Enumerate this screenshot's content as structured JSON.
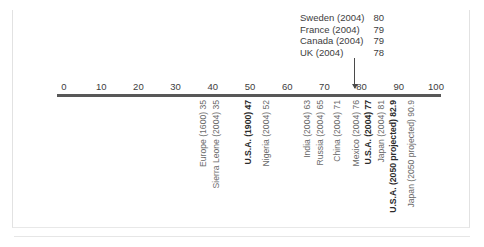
{
  "chart_data": {
    "type": "scatter",
    "title": "",
    "subtitle": "",
    "xlabel": "",
    "ylabel": "",
    "xlim": [
      0,
      100
    ],
    "xticks": [
      0,
      10,
      20,
      30,
      40,
      50,
      60,
      70,
      80,
      90,
      100
    ],
    "tick_labels": [
      "0",
      "10",
      "20",
      "30",
      "40",
      "50",
      "60",
      "70",
      "80",
      "90",
      "100"
    ],
    "grid": false,
    "legend": "none",
    "axis_color": "#585858",
    "text_color": "#3d3d3d",
    "points": [
      {
        "label": "Europe (1600) 35",
        "name": "Europe",
        "year": "1600",
        "value": 35,
        "bold": false
      },
      {
        "label": "Sierra Leone (2004) 35",
        "name": "Sierra Leone",
        "year": "2004",
        "value": 35,
        "bold": false
      },
      {
        "label": "U.S.A. (1900) 47",
        "name": "U.S.A.",
        "year": "1900",
        "value": 47,
        "bold": true
      },
      {
        "label": "Nigeria (2004) 52",
        "name": "Nigeria",
        "year": "2004",
        "value": 52,
        "bold": false
      },
      {
        "label": "India (2004) 63",
        "name": "India",
        "year": "2004",
        "value": 63,
        "bold": false
      },
      {
        "label": "Russia (2004) 65",
        "name": "Russia",
        "year": "2004",
        "value": 65,
        "bold": false
      },
      {
        "label": "China (2004) 71",
        "name": "China",
        "year": "2004",
        "value": 71,
        "bold": false
      },
      {
        "label": "Mexico (2004) 76",
        "name": "Mexico",
        "year": "2004",
        "value": 76,
        "bold": false
      },
      {
        "label": "U.S.A. (2004) 77",
        "name": "U.S.A.",
        "year": "2004",
        "value": 77,
        "bold": true
      },
      {
        "label": "Japan (2004) 81",
        "name": "Japan",
        "year": "2004",
        "value": 81,
        "bold": false
      },
      {
        "label": "U.S.A. (2050 projected) 82.9",
        "name": "U.S.A.",
        "year": "2050 projected",
        "value": 82.9,
        "bold": true
      },
      {
        "label": "Japan (2050 projected) 90.9",
        "name": "Japan",
        "year": "2050 projected",
        "value": 90.9,
        "bold": false
      }
    ],
    "callout": {
      "target_value": 78,
      "rows": [
        {
          "name": "Sweden (2004)",
          "value": "80"
        },
        {
          "name": "France (2004)",
          "value": "79"
        },
        {
          "name": "Canada (2004)",
          "value": "79"
        },
        {
          "name": "UK (2004)",
          "value": "78"
        }
      ]
    }
  }
}
